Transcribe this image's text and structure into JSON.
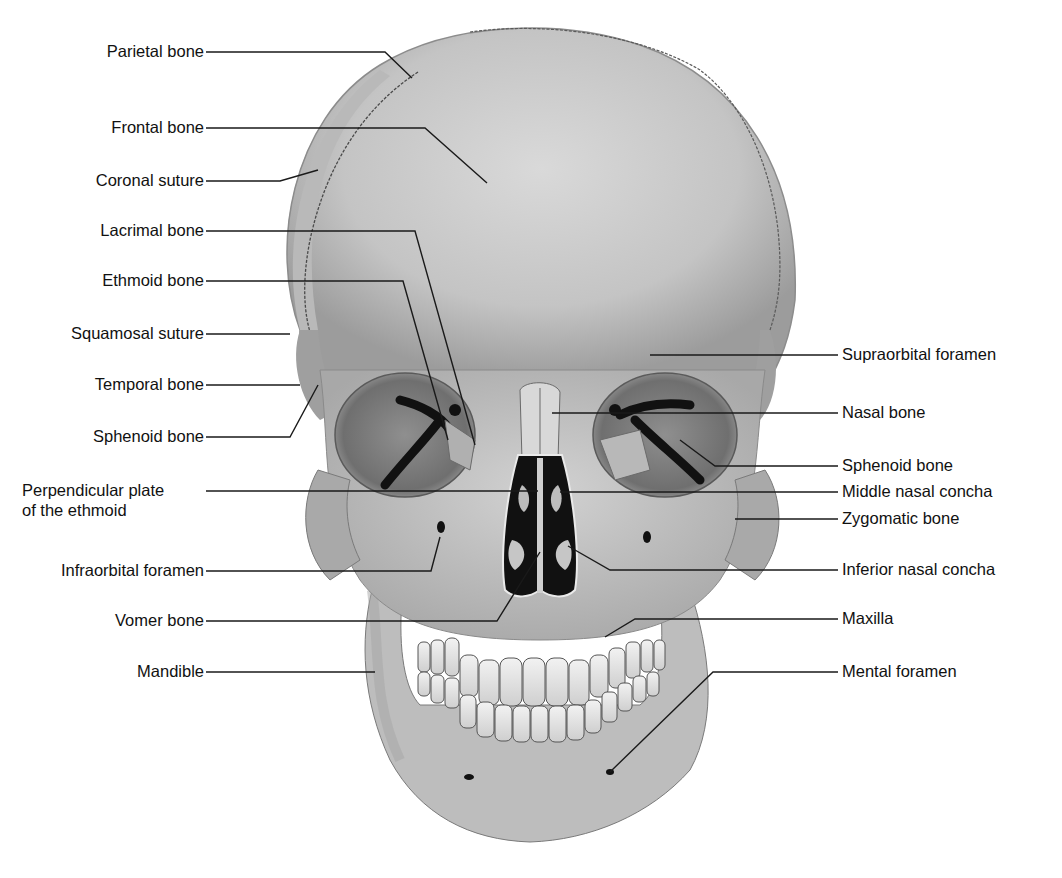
{
  "figure": {
    "labels_left": [
      {
        "id": "parietal-bone",
        "text": "Parietal bone",
        "y": 52
      },
      {
        "id": "frontal-bone",
        "text": "Frontal bone",
        "y": 128
      },
      {
        "id": "coronal-suture",
        "text": "Coronal suture",
        "y": 181
      },
      {
        "id": "lacrimal-bone",
        "text": "Lacrimal bone",
        "y": 231
      },
      {
        "id": "ethmoid-bone",
        "text": "Ethmoid bone",
        "y": 281
      },
      {
        "id": "squamosal-suture",
        "text": "Squamosal suture",
        "y": 334
      },
      {
        "id": "temporal-bone",
        "text": "Temporal bone",
        "y": 385
      },
      {
        "id": "sphenoid-bone-left",
        "text": "Sphenoid bone",
        "y": 437
      },
      {
        "id": "perpendicular-plate",
        "text": "Perpendicular plate",
        "text2": "of the ethmoid",
        "y": 491
      },
      {
        "id": "infraorbital-foramen",
        "text": "Infraorbital foramen",
        "y": 571
      },
      {
        "id": "vomer-bone",
        "text": "Vomer bone",
        "y": 621
      },
      {
        "id": "mandible",
        "text": "Mandible",
        "y": 672
      }
    ],
    "labels_right": [
      {
        "id": "supraorbital-foramen",
        "text": "Supraorbital foramen",
        "y": 355
      },
      {
        "id": "nasal-bone",
        "text": "Nasal bone",
        "y": 413
      },
      {
        "id": "sphenoid-bone-right",
        "text": "Sphenoid bone",
        "y": 466
      },
      {
        "id": "middle-nasal-concha",
        "text": "Middle nasal concha",
        "y": 492
      },
      {
        "id": "zygomatic-bone",
        "text": "Zygomatic bone",
        "y": 519
      },
      {
        "id": "inferior-nasal-concha",
        "text": "Inferior nasal concha",
        "y": 570
      },
      {
        "id": "maxilla",
        "text": "Maxilla",
        "y": 619
      },
      {
        "id": "mental-foramen",
        "text": "Mental foramen",
        "y": 672
      }
    ],
    "colors": {
      "background": "#ffffff",
      "bone_light": "#d4d4d4",
      "bone_mid": "#b4b4b4",
      "bone_dark": "#8a8a8a",
      "cavity": "#111111",
      "leader_line": "#1a1a1a",
      "text": "#111111"
    }
  }
}
